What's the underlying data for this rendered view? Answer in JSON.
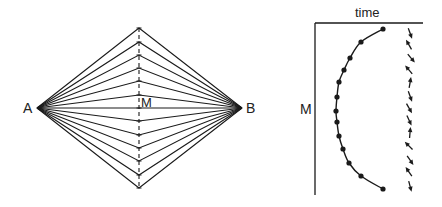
{
  "left_panel": {
    "label_a": "A",
    "label_b": "B",
    "label_m": "M",
    "vertex_a": [
      37,
      108
    ],
    "vertex_b": [
      242,
      108
    ],
    "midline_x": 139,
    "midline_top": 28,
    "midline_bottom": 188,
    "path_bend_ys": [
      28,
      42,
      55,
      68,
      81,
      95,
      108,
      121,
      135,
      148,
      161,
      175,
      188
    ]
  },
  "right_panel": {
    "axis_label_top": "time",
    "axis_label_left": "M",
    "axis_origin": [
      315,
      23
    ],
    "axis_right_end": 423,
    "axis_bottom_end": 195,
    "curve_points": [
      [
        383,
        29
      ],
      [
        361,
        42
      ],
      [
        350,
        58
      ],
      [
        344,
        70
      ],
      [
        339,
        82
      ],
      [
        337,
        97
      ],
      [
        336,
        111
      ],
      [
        337,
        122
      ],
      [
        339,
        136
      ],
      [
        343,
        149
      ],
      [
        349,
        163
      ],
      [
        361,
        176
      ],
      [
        383,
        189
      ]
    ],
    "arrows": [
      {
        "x": 410,
        "y": 33,
        "angle": 160
      },
      {
        "x": 409,
        "y": 45,
        "angle": -30
      },
      {
        "x": 411,
        "y": 58,
        "angle": 140
      },
      {
        "x": 409,
        "y": 70,
        "angle": -40
      },
      {
        "x": 410,
        "y": 83,
        "angle": 10
      },
      {
        "x": 410,
        "y": 96,
        "angle": 160
      },
      {
        "x": 409,
        "y": 108,
        "angle": 150
      },
      {
        "x": 409,
        "y": 120,
        "angle": 155
      },
      {
        "x": 410,
        "y": 133,
        "angle": 5
      },
      {
        "x": 409,
        "y": 146,
        "angle": -45
      },
      {
        "x": 410,
        "y": 160,
        "angle": 145
      },
      {
        "x": 409,
        "y": 172,
        "angle": -35
      },
      {
        "x": 410,
        "y": 186,
        "angle": 165
      }
    ]
  },
  "colors": {
    "stroke": "#1a1a1a",
    "background": "#ffffff"
  }
}
